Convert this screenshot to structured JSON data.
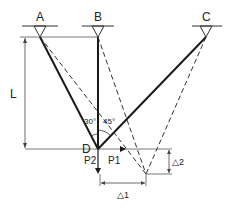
{
  "diagram": {
    "type": "truss-displacement",
    "supports": [
      {
        "id": "A",
        "label": "A"
      },
      {
        "id": "B",
        "label": "B"
      },
      {
        "id": "C",
        "label": "C"
      }
    ],
    "joint": {
      "label": "D"
    },
    "angles": {
      "AD_BD": "30°",
      "BD_CD": "45°"
    },
    "loads": {
      "horizontal": "P1",
      "vertical": "P2"
    },
    "dimensions": {
      "height": "L",
      "dx": "△1",
      "dy": "△2"
    },
    "colors": {
      "line": "#1a1a1a",
      "dashed": "#333333",
      "dim": "#555555"
    }
  }
}
